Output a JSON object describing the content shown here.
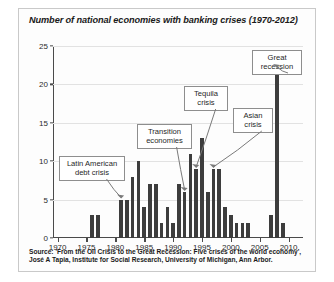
{
  "chart_data": {
    "type": "bar",
    "title": "Number of national economies with banking crises (1970-2012)",
    "xlabel": "",
    "ylabel": "",
    "ylim": [
      0,
      25
    ],
    "xlim": [
      1969.2,
      2012.5
    ],
    "yticks": [
      0,
      5,
      10,
      15,
      20,
      25
    ],
    "xticks": [
      1970,
      1975,
      1980,
      1985,
      1990,
      1995,
      2000,
      2005,
      2010
    ],
    "grid": true,
    "legend": null,
    "bar_color": "#3d3d3d",
    "categories": [
      1970,
      1971,
      1972,
      1973,
      1974,
      1975,
      1976,
      1977,
      1978,
      1979,
      1980,
      1981,
      1982,
      1983,
      1984,
      1985,
      1986,
      1987,
      1988,
      1989,
      1990,
      1991,
      1992,
      1993,
      1994,
      1995,
      1996,
      1997,
      1998,
      1999,
      2000,
      2001,
      2002,
      2003,
      2004,
      2005,
      2006,
      2007,
      2008,
      2009,
      2010,
      2011,
      2012
    ],
    "values": [
      0,
      0,
      0,
      0,
      0,
      0,
      3,
      3,
      0,
      0,
      0,
      5,
      5,
      8,
      10,
      4,
      7,
      7,
      2,
      4,
      2,
      7,
      6,
      11,
      9,
      13,
      6,
      9,
      9,
      4,
      3,
      2,
      2,
      2,
      0,
      0,
      0,
      3,
      22,
      2,
      0,
      0,
      0
    ],
    "annotations": [
      {
        "label": "Latin American\ndebt crisis",
        "points_to_year": 1981,
        "points_to_value": 5
      },
      {
        "label": "Transition\neconomies",
        "points_to_year": 1992,
        "points_to_value": 6
      },
      {
        "label": "Tequila\ncrisis",
        "points_to_year": 1994,
        "points_to_value": 9
      },
      {
        "label": "Asian\ncrisis",
        "points_to_year": 1997,
        "points_to_value": 9
      },
      {
        "label": "Great\nrecession",
        "points_to_year": 2008,
        "points_to_value": 22
      }
    ]
  },
  "source": {
    "line1": "Source: 'From the Oil Crisis to the Great Recession: Five crises of the world economy',",
    "line2": "José A Tapia, Institute for Social Research, University of Michigan, Ann Arbor."
  }
}
